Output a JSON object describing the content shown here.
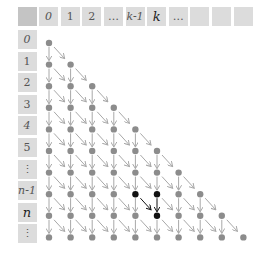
{
  "diagram": {
    "title": "",
    "header_cells": [
      "",
      "0",
      "1",
      "2",
      "…",
      "k-1",
      "k",
      "…",
      "",
      "",
      ""
    ],
    "row_labels": [
      "0",
      "1",
      "2",
      "3",
      "4",
      "5",
      "⋮",
      "n-1",
      "n",
      "⋮"
    ],
    "rows": 10,
    "highlight": {
      "black_dots": [
        {
          "row": 7,
          "col": 4,
          "label": "(n-1, k-1)"
        },
        {
          "row": 7,
          "col": 5,
          "label": "(n-1, k)"
        },
        {
          "row": 8,
          "col": 5,
          "label": "(n, k)"
        }
      ],
      "dark_arrows": [
        {
          "from": [
            7,
            4
          ],
          "to": [
            8,
            5
          ],
          "type": "diagonal"
        },
        {
          "from": [
            7,
            5
          ],
          "to": [
            8,
            5
          ],
          "type": "down"
        }
      ]
    },
    "colors": {
      "cell": "#dcdcdc",
      "corner": "#c4c4c4",
      "dot": "#8c8c8c",
      "arrow": "#a8a8a8",
      "highlight": "#111111"
    }
  }
}
